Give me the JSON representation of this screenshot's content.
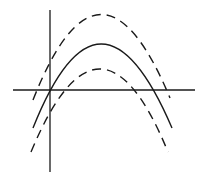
{
  "diagram": {
    "background_color": "#ffffff",
    "stroke_color": "#1a1a1a",
    "axes": {
      "x_axis": {
        "x1": 13,
        "x2": 195,
        "y": 90
      },
      "y_axis": {
        "x": 50,
        "y1": 10,
        "y2": 172
      },
      "labels": []
    },
    "curves": [
      {
        "name": "upper-dashed-parabola",
        "style": "dashed",
        "vertex": [
          100,
          15
        ],
        "left_end": [
          33,
          100
        ],
        "right_end": [
          170,
          98
        ]
      },
      {
        "name": "solid-parabola",
        "style": "solid",
        "vertex": [
          99,
          44
        ],
        "left_end": [
          33,
          128
        ],
        "right_end": [
          172,
          128
        ],
        "x_intercepts": [
          [
            49,
            90
          ],
          [
            155,
            90
          ]
        ]
      },
      {
        "name": "lower-dashed-parabola",
        "style": "dashed",
        "vertex": [
          100,
          69
        ],
        "left_end": [
          31,
          152
        ],
        "right_end": [
          168,
          152
        ]
      }
    ]
  }
}
